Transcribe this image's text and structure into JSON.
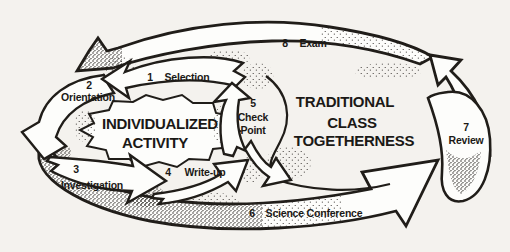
{
  "figure": {
    "background": "#f4f2ee",
    "ink": "#201d19",
    "paper": "#fdfdfb"
  },
  "inner_title": {
    "line1": "INDIVIDUALIZED",
    "line2": "ACTIVITY"
  },
  "outer_title": {
    "line1": "TRADITIONAL",
    "line2": "CLASS",
    "line3": "TOGETHERNESS"
  },
  "steps": [
    {
      "num": "1",
      "label": "Selection"
    },
    {
      "num": "2",
      "label": "Orientation"
    },
    {
      "num": "3",
      "label": "Investigation"
    },
    {
      "num": "4",
      "label": "Write-up"
    },
    {
      "num": "5",
      "label1": "Check",
      "label2": "Point"
    },
    {
      "num": "6",
      "label": "Science Conference"
    },
    {
      "num": "7",
      "label": "Review"
    },
    {
      "num": "8",
      "label": "Exam"
    }
  ]
}
